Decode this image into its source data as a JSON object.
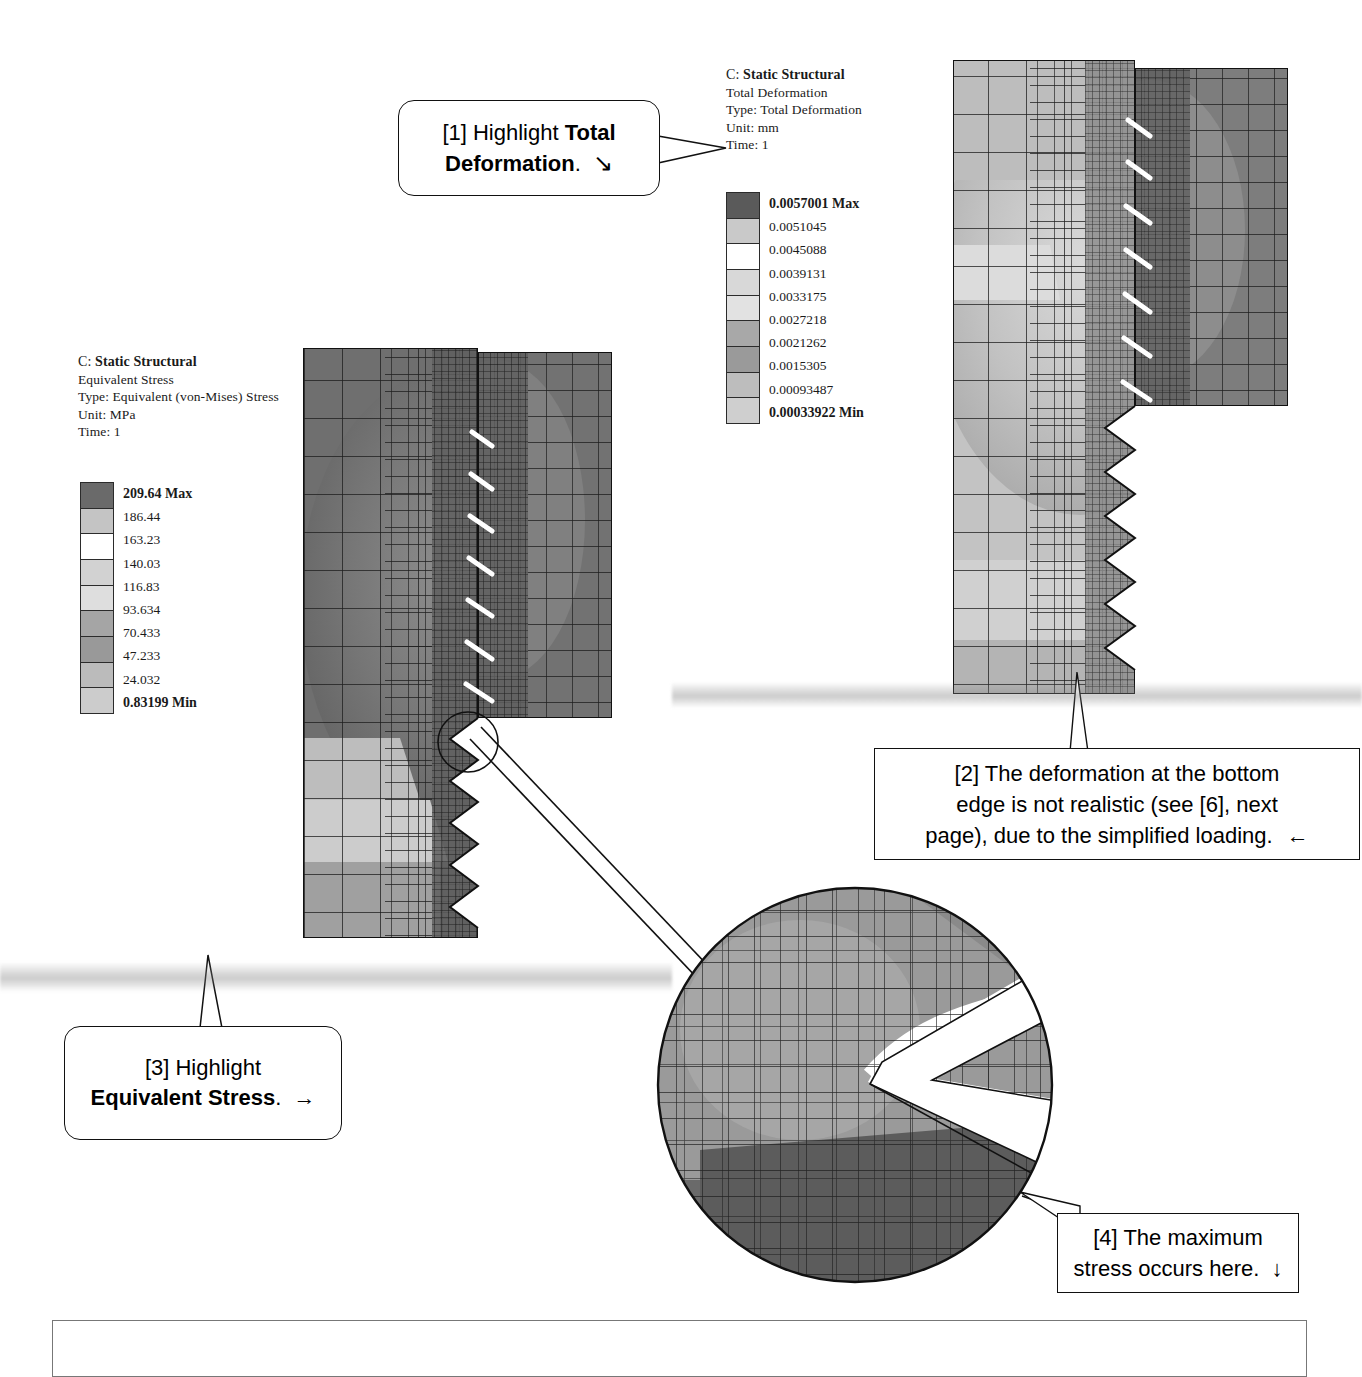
{
  "page": {
    "background": "#ffffff",
    "width": 1361,
    "height": 1377
  },
  "deformation_result": {
    "solver_id": "C:",
    "study_name": "Static Structural",
    "result_name": "Total Deformation",
    "type_line": "Type: Total Deformation",
    "unit_line": "Unit: mm",
    "time_line": "Time: 1",
    "legend": {
      "max_label": "0.0057001 Max",
      "min_label": "0.00033922 Min",
      "values": [
        "0.0057001 Max",
        "0.0051045",
        "0.0045088",
        "0.0039131",
        "0.0033175",
        "0.0027218",
        "0.0021262",
        "0.0015305",
        "0.00093487",
        "0.00033922 Min"
      ],
      "swatch_colors": [
        "#5a5a5a",
        "#c9c9c9",
        "#ffffff",
        "#d8d8d8",
        "#e2e2e2",
        "#a8a8a8",
        "#9a9a9a",
        "#bdbdbd",
        "#cfcfcf",
        "#6b6b6b"
      ]
    }
  },
  "stress_result": {
    "solver_id": "C:",
    "study_name": "Static Structural",
    "result_name": "Equivalent Stress",
    "type_line": "Type: Equivalent (von-Mises) Stress",
    "unit_line": "Unit: MPa",
    "time_line": "Time: 1",
    "legend": {
      "max_label": "209.64 Max",
      "min_label": "0.83199 Min",
      "values": [
        "209.64 Max",
        "186.44",
        "163.23",
        "140.03",
        "116.83",
        "93.634",
        "70.433",
        "47.233",
        "24.032",
        "0.83199 Min"
      ],
      "swatch_colors": [
        "#6a6a6a",
        "#c4c4c4",
        "#ffffff",
        "#d2d2d2",
        "#dedede",
        "#a5a5a5",
        "#999999",
        "#bbbbbb",
        "#cccccc",
        "#6e6e6e"
      ]
    }
  },
  "callouts": [
    {
      "id": "callout-1",
      "marker": "[1]",
      "text_plain": "[1] Highlight Total Deformation.",
      "line1_prefix": "[1] Highlight ",
      "line1_bold": "Total",
      "line2_bold": "Deformation",
      "line2_suffix": ".",
      "arrow": "↘",
      "style": "rounded",
      "tail_direction": "right"
    },
    {
      "id": "callout-2",
      "marker": "[2]",
      "line1": "[2] The deformation at the bottom",
      "line2": "edge is not realistic (see [6], next",
      "line3": "page), due to the simplified loading.",
      "arrow": "←",
      "style": "rectangle",
      "tail_direction": "up"
    },
    {
      "id": "callout-3",
      "marker": "[3]",
      "line1_prefix": "[3] Highlight",
      "line2_bold": "Equivalent Stress",
      "line2_suffix": ".",
      "arrow": "→",
      "style": "rounded",
      "tail_direction": "up"
    },
    {
      "id": "callout-4",
      "marker": "[4]",
      "line1": "[4] The maximum",
      "line2": "stress occurs here.",
      "arrow": "↓",
      "style": "rectangle",
      "tail_direction": "left"
    }
  ],
  "figures": {
    "deformation_plot_name": "total-deformation-contour-plot",
    "stress_plot_name": "equivalent-stress-contour-plot",
    "detail_view_name": "thread-root-detail-magnified-view"
  }
}
